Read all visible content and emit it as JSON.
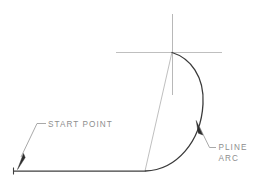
{
  "drawing": {
    "title": "PLINE Arc Construction Diagram",
    "background_color": "#ffffff",
    "line_color_heavy": "#3a3a3a",
    "line_color_light": "#b4b4b4",
    "text_color": "#8e8e8e"
  },
  "labels": {
    "start_point": "START  POINT",
    "pline": "PLINE",
    "arc": "ARC"
  },
  "geometry": {
    "polyline_start": {
      "x": 13,
      "y": 171
    },
    "polyline_arc_start": {
      "x": 145,
      "y": 171
    },
    "arc_center": {
      "x": 172,
      "y": 52
    },
    "arc_end": {
      "x": 172,
      "y": 52
    },
    "arc_rightmost": {
      "x": 203,
      "y": 105
    },
    "crosshair_horizontal": {
      "x1": 116,
      "x2": 222,
      "y": 52
    },
    "crosshair_vertical": {
      "x": 172,
      "y1": 14,
      "y2": 95
    }
  },
  "leaders": {
    "start_point_arrow_tip": {
      "x": 20,
      "y": 158
    },
    "pline_arrow_tip": {
      "x": 197,
      "y": 122
    }
  }
}
